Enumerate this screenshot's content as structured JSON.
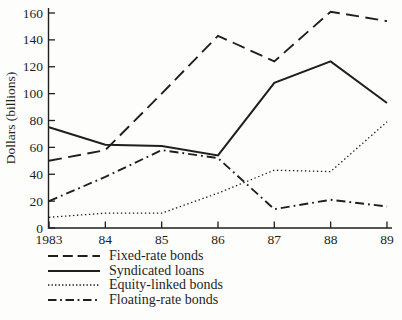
{
  "chart_data": {
    "type": "line",
    "title": "",
    "xlabel": "",
    "ylabel": "Dollars (billions)",
    "categories": [
      "1983",
      "84",
      "85",
      "86",
      "87",
      "88",
      "89"
    ],
    "ylim": [
      0,
      160
    ],
    "yticks": [
      0,
      20,
      40,
      60,
      80,
      100,
      120,
      140,
      160
    ],
    "grid": false,
    "legend_position": "bottom-left",
    "series": [
      {
        "name": "Fixed-rate bonds",
        "style": "dashed",
        "values": [
          50,
          58,
          100,
          143,
          124,
          161,
          154
        ]
      },
      {
        "name": "Syndicated loans",
        "style": "solid",
        "values": [
          75,
          62,
          61,
          54,
          108,
          124,
          93
        ]
      },
      {
        "name": "Equity-linked bonds",
        "style": "dotted",
        "values": [
          8,
          11,
          11,
          26,
          43,
          42,
          79
        ]
      },
      {
        "name": "Floating-rate bonds",
        "style": "dashdot",
        "values": [
          20,
          38,
          58,
          52,
          14,
          21,
          16
        ]
      }
    ]
  },
  "colors": {
    "ink": "#1f1f1f",
    "background": "#fdfdfb"
  }
}
